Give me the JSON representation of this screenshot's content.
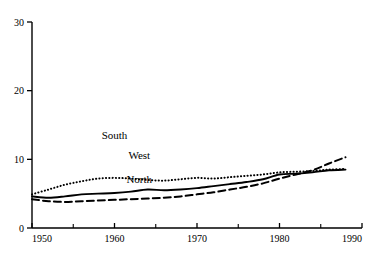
{
  "chart_data": {
    "type": "line",
    "title": "",
    "xlabel": "",
    "ylabel": "",
    "xlim": [
      1950,
      1990
    ],
    "ylim": [
      0,
      30
    ],
    "grid": false,
    "legend_position": "inline-annotations",
    "x_ticks_major": [
      1950,
      1960,
      1970,
      1980,
      1990
    ],
    "x_ticks_minor": [
      1955,
      1965,
      1975,
      1985
    ],
    "y_ticks_major": [
      0,
      10,
      20,
      30
    ],
    "x_tick_labels": [
      "1950",
      "1960",
      "1970",
      "1980",
      "1990"
    ],
    "y_tick_labels": [
      "0",
      "10",
      "20",
      "30"
    ],
    "x": [
      1950,
      1952,
      1954,
      1956,
      1958,
      1960,
      1962,
      1964,
      1966,
      1968,
      1970,
      1972,
      1974,
      1976,
      1978,
      1980,
      1982,
      1984,
      1986,
      1988
    ],
    "series": [
      {
        "name": "South",
        "style": "dotted",
        "label": "South",
        "label_x": 1960,
        "label_y": 13.0,
        "values": [
          4.9,
          5.6,
          6.3,
          6.8,
          7.2,
          7.3,
          7.2,
          7.0,
          6.9,
          7.1,
          7.3,
          7.2,
          7.4,
          7.6,
          7.8,
          8.1,
          8.2,
          8.3,
          8.5,
          8.6
        ]
      },
      {
        "name": "West",
        "style": "solid",
        "label": "West",
        "label_x": 1963,
        "label_y": 10.0,
        "values": [
          4.6,
          4.4,
          4.6,
          4.9,
          5.0,
          5.1,
          5.3,
          5.6,
          5.5,
          5.6,
          5.8,
          6.1,
          6.4,
          6.7,
          7.1,
          7.8,
          7.9,
          8.1,
          8.4,
          8.5
        ]
      },
      {
        "name": "North",
        "style": "dashed",
        "label": "North",
        "label_x": 1963,
        "label_y": 6.6,
        "values": [
          4.2,
          3.9,
          3.8,
          3.9,
          4.0,
          4.1,
          4.2,
          4.3,
          4.4,
          4.6,
          4.9,
          5.2,
          5.6,
          6.0,
          6.5,
          7.2,
          7.8,
          8.4,
          9.4,
          10.3
        ]
      }
    ]
  },
  "axes": {
    "y_axis_name": "value-axis",
    "x_axis_name": "year-axis"
  }
}
